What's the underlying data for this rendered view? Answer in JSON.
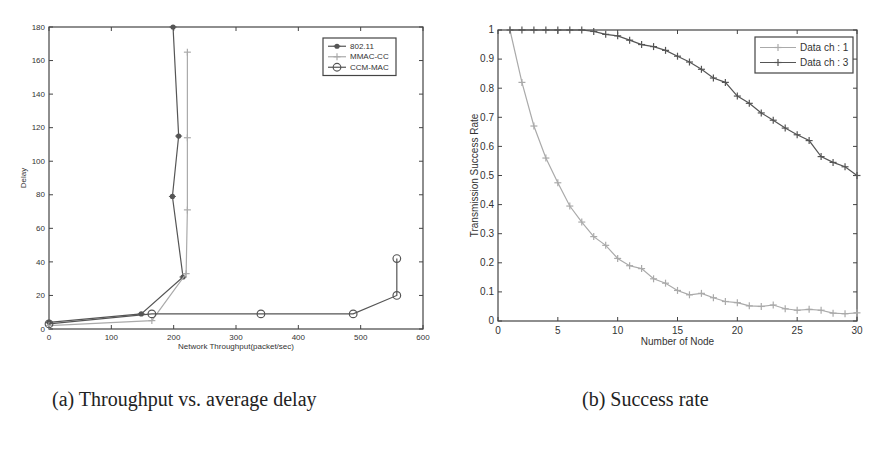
{
  "captions": {
    "a": "(a) Throughput vs. average delay",
    "b": "(b) Success rate"
  },
  "colors": {
    "axis": "#444444",
    "series_dark": "#555555",
    "series_light": "#aaaaaa"
  },
  "chart_data": [
    {
      "type": "line",
      "title": "",
      "xlabel": "Network Throughput(packet/sec)",
      "ylabel": "Delay",
      "xlim": [
        0,
        600
      ],
      "ylim": [
        0,
        180
      ],
      "xticks": [
        0,
        100,
        200,
        300,
        400,
        500,
        600
      ],
      "yticks": [
        0,
        20,
        40,
        60,
        80,
        100,
        120,
        140,
        160,
        180
      ],
      "grid": false,
      "legend_position": "upper right",
      "series": [
        {
          "name": "802.11",
          "marker": "asterisk",
          "color": "#555555",
          "x": [
            0,
            148,
            215,
            198,
            208,
            199
          ],
          "y": [
            4,
            9,
            31,
            79,
            115,
            180
          ]
        },
        {
          "name": "MMAC-CC",
          "marker": "plus",
          "color": "#aaaaaa",
          "x": [
            0,
            165,
            220,
            222,
            222,
            222
          ],
          "y": [
            2,
            5,
            33,
            71,
            114,
            165
          ]
        },
        {
          "name": "CCM-MAC",
          "marker": "circle",
          "color": "#555555",
          "x": [
            0,
            165,
            340,
            488,
            558,
            558
          ],
          "y": [
            3,
            9,
            9,
            9,
            20,
            42
          ]
        }
      ]
    },
    {
      "type": "line",
      "title": "",
      "xlabel": "Number of Node",
      "ylabel": "Transmission Success Rate",
      "xlim": [
        0,
        30
      ],
      "ylim": [
        0,
        1
      ],
      "xticks": [
        0,
        5,
        10,
        15,
        20,
        25,
        30
      ],
      "yticks": [
        0,
        0.1,
        0.2,
        0.3,
        0.4,
        0.5,
        0.6,
        0.7,
        0.8,
        0.9,
        1
      ],
      "grid": false,
      "legend_position": "upper right",
      "x": [
        1,
        2,
        3,
        4,
        5,
        6,
        7,
        8,
        9,
        10,
        11,
        12,
        13,
        14,
        15,
        16,
        17,
        18,
        19,
        20,
        21,
        22,
        23,
        24,
        25,
        26,
        27,
        28,
        29,
        30
      ],
      "series": [
        {
          "name": "Data ch : 1",
          "marker": "plus",
          "color": "#aaaaaa",
          "values": [
            1.0,
            0.82,
            0.67,
            0.56,
            0.475,
            0.395,
            0.34,
            0.29,
            0.26,
            0.215,
            0.19,
            0.18,
            0.145,
            0.13,
            0.105,
            0.09,
            0.095,
            0.08,
            0.067,
            0.063,
            0.052,
            0.05,
            0.055,
            0.042,
            0.037,
            0.04,
            0.037,
            0.027,
            0.025,
            0.028
          ]
        },
        {
          "name": "Data ch : 3",
          "marker": "plus",
          "color": "#555555",
          "values": [
            1,
            1,
            1,
            1,
            1,
            1,
            1,
            0.995,
            0.985,
            0.98,
            0.965,
            0.95,
            0.943,
            0.93,
            0.91,
            0.89,
            0.865,
            0.835,
            0.82,
            0.773,
            0.748,
            0.715,
            0.69,
            0.663,
            0.64,
            0.62,
            0.565,
            0.545,
            0.53,
            0.5
          ]
        }
      ]
    }
  ]
}
